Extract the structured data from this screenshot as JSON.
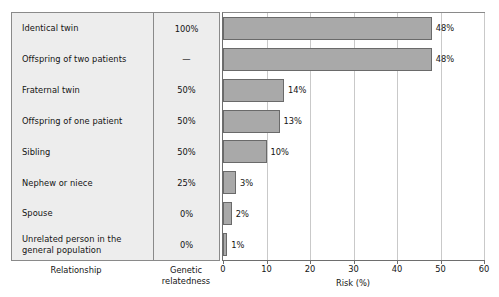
{
  "chart_data": {
    "type": "bar",
    "orientation": "horizontal",
    "title": "",
    "xlabel": "Risk (%)",
    "ylabel": "Relationship",
    "xlim": [
      0,
      60
    ],
    "xticks": [
      0,
      10,
      20,
      30,
      40,
      50,
      60
    ],
    "grid": true,
    "legend": "none",
    "categories": [
      "Identical twin",
      "Offspring of two patients",
      "Fraternal twin",
      "Offspring of one patient",
      "Sibling",
      "Nephew or niece",
      "Spouse",
      "Unrelated person in the general population"
    ],
    "values": [
      48,
      48,
      14,
      13,
      10,
      3,
      2,
      1
    ],
    "value_labels": [
      "48%",
      "48%",
      "14%",
      "13%",
      "10%",
      "3%",
      "2%",
      "1%"
    ],
    "genetic_relatedness": [
      "100%",
      "—",
      "50%",
      "50%",
      "50%",
      "25%",
      "0%",
      "0%"
    ],
    "series": [
      {
        "name": "Risk (%)",
        "values": [
          48,
          48,
          14,
          13,
          10,
          3,
          2,
          1
        ]
      }
    ]
  },
  "table": {
    "column_headers": {
      "relationship": "Relationship",
      "genetic_relatedness_line1": "Genetic",
      "genetic_relatedness_line2": "relatedness"
    },
    "rows": [
      {
        "relationship": "Identical twin",
        "genetic": "100%",
        "risk_label": "48%",
        "risk": 48
      },
      {
        "relationship": "Offspring of two patients",
        "genetic": "—",
        "risk_label": "48%",
        "risk": 48
      },
      {
        "relationship": "Fraternal twin",
        "genetic": "50%",
        "risk_label": "14%",
        "risk": 14
      },
      {
        "relationship": "Offspring of one patient",
        "genetic": "50%",
        "risk_label": "13%",
        "risk": 13
      },
      {
        "relationship": "Sibling",
        "genetic": "50%",
        "risk_label": "10%",
        "risk": 10
      },
      {
        "relationship": "Nephew or niece",
        "genetic": "25%",
        "risk_label": "3%",
        "risk": 3
      },
      {
        "relationship": "Spouse",
        "genetic": "0%",
        "risk_label": "2%",
        "risk": 2
      },
      {
        "relationship": "Unrelated person in the general population",
        "genetic": "0%",
        "risk_label": "1%",
        "risk": 1
      }
    ]
  },
  "axis": {
    "title": "Risk (%)",
    "tick_labels": [
      "0",
      "10",
      "20",
      "30",
      "40",
      "50",
      "60"
    ]
  },
  "colors": {
    "bar_fill": "#a9a9a9",
    "bar_stroke": "#6a6a6a",
    "table_background": "#ededed",
    "frame": "#8a8a8a",
    "gridline": "#c9c9c9",
    "text": "#141414"
  }
}
